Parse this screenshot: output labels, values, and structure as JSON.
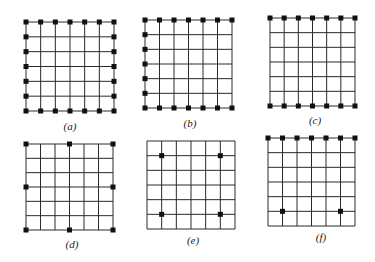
{
  "figure": {
    "background": "#ffffff",
    "line_color": "#2a2a2a",
    "node_color": "#111111",
    "grid_divisions": 6,
    "panels": [
      {
        "id": "a",
        "label": "(a)",
        "box": {
          "x": 26,
          "y": 22,
          "w": 88,
          "h": 89
        },
        "label_pos": {
          "x": 70,
          "y": 130
        },
        "nodes": [
          [
            0,
            0
          ],
          [
            1,
            0
          ],
          [
            2,
            0
          ],
          [
            3,
            0
          ],
          [
            4,
            0
          ],
          [
            5,
            0
          ],
          [
            6,
            0
          ],
          [
            0,
            1
          ],
          [
            0,
            2
          ],
          [
            0,
            3
          ],
          [
            0,
            4
          ],
          [
            0,
            5
          ],
          [
            6,
            1
          ],
          [
            6,
            2
          ],
          [
            6,
            3
          ],
          [
            6,
            4
          ],
          [
            6,
            5
          ],
          [
            0,
            6
          ],
          [
            1,
            6
          ],
          [
            2,
            6
          ],
          [
            3,
            6
          ],
          [
            4,
            6
          ],
          [
            5,
            6
          ],
          [
            6,
            6
          ]
        ]
      },
      {
        "id": "b",
        "label": "(b)",
        "box": {
          "x": 145,
          "y": 20,
          "w": 87,
          "h": 88
        },
        "label_pos": {
          "x": 190,
          "y": 127
        },
        "nodes": [
          [
            0,
            0
          ],
          [
            1,
            0
          ],
          [
            2,
            0
          ],
          [
            3,
            0
          ],
          [
            4,
            0
          ],
          [
            5,
            0
          ],
          [
            6,
            0
          ],
          [
            0,
            1
          ],
          [
            0,
            2
          ],
          [
            0,
            3
          ],
          [
            0,
            4
          ],
          [
            0,
            5
          ],
          [
            0,
            6
          ],
          [
            1,
            6
          ],
          [
            2,
            6
          ],
          [
            3,
            6
          ],
          [
            4,
            6
          ],
          [
            5,
            6
          ],
          [
            6,
            6
          ]
        ]
      },
      {
        "id": "c",
        "label": "(c)",
        "box": {
          "x": 270,
          "y": 18,
          "w": 85,
          "h": 88
        },
        "label_pos": {
          "x": 315,
          "y": 124
        },
        "nodes": [
          [
            0,
            0
          ],
          [
            1,
            0
          ],
          [
            2,
            0
          ],
          [
            3,
            0
          ],
          [
            4,
            0
          ],
          [
            5,
            0
          ],
          [
            6,
            0
          ],
          [
            0,
            6
          ],
          [
            1,
            6
          ],
          [
            2,
            6
          ],
          [
            3,
            6
          ],
          [
            4,
            6
          ],
          [
            5,
            6
          ],
          [
            6,
            6
          ]
        ]
      },
      {
        "id": "d",
        "label": "(d)",
        "box": {
          "x": 26,
          "y": 144,
          "w": 87,
          "h": 86
        },
        "label_pos": {
          "x": 72,
          "y": 248
        },
        "nodes": [
          [
            0,
            0
          ],
          [
            3,
            0
          ],
          [
            6,
            0
          ],
          [
            0,
            3
          ],
          [
            6,
            3
          ],
          [
            0,
            6
          ],
          [
            3,
            6
          ],
          [
            6,
            6
          ]
        ]
      },
      {
        "id": "e",
        "label": "(e)",
        "box": {
          "x": 147,
          "y": 141,
          "w": 88,
          "h": 88
        },
        "label_pos": {
          "x": 193,
          "y": 244
        },
        "nodes": [
          [
            1,
            1
          ],
          [
            5,
            1
          ],
          [
            1,
            5
          ],
          [
            5,
            5
          ]
        ]
      },
      {
        "id": "f",
        "label": "(f)",
        "box": {
          "x": 268,
          "y": 138,
          "w": 87,
          "h": 88
        },
        "label_pos": {
          "x": 321,
          "y": 241
        },
        "nodes": [
          [
            0,
            0
          ],
          [
            1,
            0
          ],
          [
            2,
            0
          ],
          [
            3,
            0
          ],
          [
            4,
            0
          ],
          [
            5,
            0
          ],
          [
            6,
            0
          ],
          [
            1,
            5
          ],
          [
            5,
            5
          ]
        ]
      }
    ]
  }
}
